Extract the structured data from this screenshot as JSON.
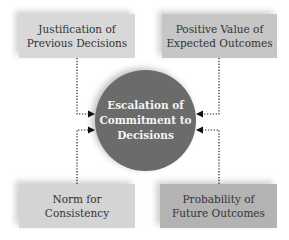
{
  "diagram": {
    "center": {
      "label": "Escalation of Commitment to Decisions",
      "lines": [
        "Escalation of",
        "Commitment to",
        "Decisions"
      ],
      "color": "#6b6b6b"
    },
    "factors": [
      {
        "id": "top-left",
        "lines": [
          "Justification of",
          "Previous Decisions"
        ],
        "color": "#d8d8d8"
      },
      {
        "id": "top-right",
        "lines": [
          "Positive Value of",
          "Expected Outcomes"
        ],
        "color": "#c6c6c6"
      },
      {
        "id": "bottom-left",
        "lines": [
          "Norm for",
          "Consistency"
        ],
        "color": "#d4d4d4"
      },
      {
        "id": "bottom-right",
        "lines": [
          "Probability of",
          "Future Outcomes"
        ],
        "color": "#b3b3b3"
      }
    ],
    "connector_style": "dotted-arrow"
  }
}
